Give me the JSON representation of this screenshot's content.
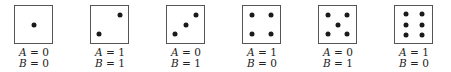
{
  "figure": {
    "dice": [
      {
        "pips": 1,
        "A": "0",
        "B": "0",
        "pip_positions": [
          [
            0.5,
            0.5
          ]
        ]
      },
      {
        "pips": 2,
        "A": "1",
        "B": "1",
        "pip_positions": [
          [
            0.78,
            0.25
          ],
          [
            0.22,
            0.75
          ]
        ]
      },
      {
        "pips": 3,
        "A": "0",
        "B": "1",
        "pip_positions": [
          [
            0.78,
            0.25
          ],
          [
            0.5,
            0.5
          ],
          [
            0.22,
            0.75
          ]
        ]
      },
      {
        "pips": 4,
        "A": "1",
        "B": "0",
        "pip_positions": [
          [
            0.25,
            0.25
          ],
          [
            0.75,
            0.25
          ],
          [
            0.25,
            0.75
          ],
          [
            0.75,
            0.75
          ]
        ]
      },
      {
        "pips": 5,
        "A": "0",
        "B": "1",
        "pip_positions": [
          [
            0.25,
            0.25
          ],
          [
            0.75,
            0.25
          ],
          [
            0.5,
            0.5
          ],
          [
            0.25,
            0.75
          ],
          [
            0.75,
            0.75
          ]
        ]
      },
      {
        "pips": 6,
        "A": "1",
        "B": "0",
        "pip_positions": [
          [
            0.3,
            0.22
          ],
          [
            0.72,
            0.22
          ],
          [
            0.3,
            0.5
          ],
          [
            0.72,
            0.5
          ],
          [
            0.3,
            0.78
          ],
          [
            0.72,
            0.78
          ]
        ]
      }
    ],
    "variable_a": "A",
    "variable_b": "B",
    "equals": " = ",
    "box_left_positions": [
      8,
      84,
      160,
      236,
      312,
      388
    ]
  }
}
